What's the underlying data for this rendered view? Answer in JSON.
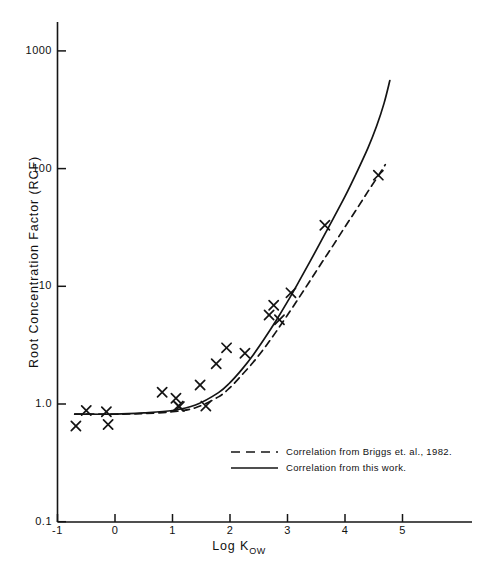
{
  "chart_data": {
    "type": "scatter",
    "title": "",
    "xlabel": "Log K_OW",
    "xlabel_main": "Log K",
    "xlabel_sub": "OW",
    "ylabel": "Root Concentration Factor (RCF)",
    "xlim": [
      -1,
      6
    ],
    "ylim": [
      0.1,
      1000
    ],
    "yscale": "log",
    "xscale": "linear",
    "grid": false,
    "xticks": [
      -1,
      0,
      1,
      2,
      3,
      4,
      5
    ],
    "xtick_labels": [
      "-1",
      "0",
      "1",
      "2",
      "3",
      "4",
      "5"
    ],
    "yticks": [
      0.1,
      1.0,
      10,
      100,
      1000
    ],
    "ytick_labels": [
      "0.1",
      "1.0",
      "10",
      "100",
      "1000"
    ],
    "legend_position": "lower-right",
    "series": [
      {
        "name": "Measured data",
        "marker": "x",
        "type": "scatter",
        "points": [
          {
            "x": -0.68,
            "y": 0.65
          },
          {
            "x": -0.5,
            "y": 0.88
          },
          {
            "x": -0.15,
            "y": 0.86
          },
          {
            "x": -0.12,
            "y": 0.67
          },
          {
            "x": 0.82,
            "y": 1.26
          },
          {
            "x": 1.06,
            "y": 1.12
          },
          {
            "x": 1.1,
            "y": 0.96
          },
          {
            "x": 1.12,
            "y": 0.95
          },
          {
            "x": 1.48,
            "y": 1.45
          },
          {
            "x": 1.58,
            "y": 0.96
          },
          {
            "x": 1.76,
            "y": 2.2
          },
          {
            "x": 1.94,
            "y": 3.0
          },
          {
            "x": 2.26,
            "y": 2.7
          },
          {
            "x": 2.68,
            "y": 5.7
          },
          {
            "x": 2.76,
            "y": 6.9
          },
          {
            "x": 2.86,
            "y": 5.2
          },
          {
            "x": 3.06,
            "y": 8.8
          },
          {
            "x": 3.65,
            "y": 33.0
          },
          {
            "x": 4.58,
            "y": 88.0
          }
        ]
      },
      {
        "name": "Correlation from Briggs et. al., 1982.",
        "type": "line",
        "style": "dashed",
        "points": [
          {
            "x": -0.7,
            "y": 0.82
          },
          {
            "x": 0.0,
            "y": 0.82
          },
          {
            "x": 0.5,
            "y": 0.83
          },
          {
            "x": 1.0,
            "y": 0.86
          },
          {
            "x": 1.4,
            "y": 0.93
          },
          {
            "x": 1.8,
            "y": 1.15
          },
          {
            "x": 2.0,
            "y": 1.38
          },
          {
            "x": 2.2,
            "y": 1.75
          },
          {
            "x": 2.4,
            "y": 2.25
          },
          {
            "x": 2.6,
            "y": 3.0
          },
          {
            "x": 2.8,
            "y": 4.1
          },
          {
            "x": 3.0,
            "y": 5.7
          },
          {
            "x": 3.2,
            "y": 8.0
          },
          {
            "x": 3.4,
            "y": 11.3
          },
          {
            "x": 3.6,
            "y": 16.0
          },
          {
            "x": 3.8,
            "y": 22.5
          },
          {
            "x": 4.0,
            "y": 32.0
          },
          {
            "x": 4.2,
            "y": 45.0
          },
          {
            "x": 4.4,
            "y": 64.0
          },
          {
            "x": 4.6,
            "y": 90.0
          },
          {
            "x": 4.7,
            "y": 108.0
          }
        ]
      },
      {
        "name": "Correlation from this work.",
        "type": "line",
        "style": "solid",
        "points": [
          {
            "x": -0.7,
            "y": 0.82
          },
          {
            "x": 0.0,
            "y": 0.82
          },
          {
            "x": 0.5,
            "y": 0.84
          },
          {
            "x": 1.0,
            "y": 0.88
          },
          {
            "x": 1.4,
            "y": 0.98
          },
          {
            "x": 1.8,
            "y": 1.25
          },
          {
            "x": 2.0,
            "y": 1.52
          },
          {
            "x": 2.2,
            "y": 1.95
          },
          {
            "x": 2.4,
            "y": 2.6
          },
          {
            "x": 2.6,
            "y": 3.6
          },
          {
            "x": 2.8,
            "y": 5.1
          },
          {
            "x": 3.0,
            "y": 7.4
          },
          {
            "x": 3.2,
            "y": 11.0
          },
          {
            "x": 3.4,
            "y": 16.5
          },
          {
            "x": 3.6,
            "y": 25.0
          },
          {
            "x": 3.8,
            "y": 38.0
          },
          {
            "x": 4.0,
            "y": 58.0
          },
          {
            "x": 4.2,
            "y": 92.0
          },
          {
            "x": 4.4,
            "y": 150.0
          },
          {
            "x": 4.55,
            "y": 230.0
          },
          {
            "x": 4.68,
            "y": 360.0
          },
          {
            "x": 4.78,
            "y": 560.0
          }
        ]
      }
    ],
    "legend": [
      {
        "label": "Correlation from Briggs et. al., 1982.",
        "style": "dashed"
      },
      {
        "label": "Correlation from this work.",
        "style": "solid"
      }
    ]
  },
  "axes": {
    "y_title": "Root Concentration Factor (RCF)",
    "x_title_main": "Log K",
    "x_title_sub": "OW"
  }
}
